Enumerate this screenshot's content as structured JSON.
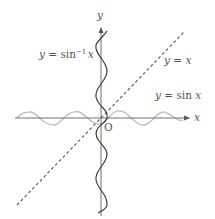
{
  "diagram": {
    "axes": {
      "x_label": "x",
      "y_label": "y",
      "origin_label": "O"
    },
    "curves": [
      {
        "id": "sin",
        "label": "y = sin x",
        "label_parts": {
          "lhs": "y",
          "eq": " = ",
          "func": "sin ",
          "var": "x"
        },
        "color": "#b8b8b8",
        "style": "solid"
      },
      {
        "id": "arcsin",
        "label": "y = sin⁻¹ x",
        "label_parts": {
          "lhs": "y",
          "eq": " = ",
          "func": "sin",
          "sup": "−1",
          "var": "x"
        },
        "color": "#444444",
        "style": "solid"
      },
      {
        "id": "identity",
        "label": "y = x",
        "label_parts": {
          "lhs": "y",
          "eq": " = ",
          "var": "x"
        },
        "color": "#555555",
        "style": "dashed"
      }
    ],
    "colors": {
      "axis": "#666666",
      "text": "#555555",
      "background": "#ffffff"
    }
  }
}
